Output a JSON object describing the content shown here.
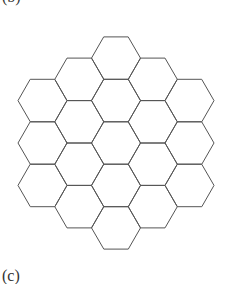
{
  "figure": {
    "label_top": "(b)",
    "label_bottom": "(c)",
    "stroke_color": "#555555",
    "background": "#ffffff"
  },
  "lattice": {
    "center_x": 116,
    "center_y": 143,
    "side": 24.5,
    "radius": 108,
    "col_range": [
      -4,
      4
    ],
    "row_range": [
      -4,
      4
    ]
  }
}
